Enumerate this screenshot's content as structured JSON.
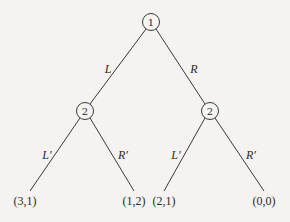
{
  "diagram": {
    "type": "extensive-form game tree",
    "nodes": [
      {
        "id": "root",
        "player": "1",
        "x": 151,
        "y": 22
      },
      {
        "id": "p2-left",
        "player": "2",
        "x": 85,
        "y": 111
      },
      {
        "id": "p2-right",
        "player": "2",
        "x": 210,
        "y": 111
      }
    ],
    "edges": [
      {
        "from": "root",
        "to": "p2-left",
        "label": "L",
        "lx": 108,
        "ly": 69
      },
      {
        "from": "root",
        "to": "p2-right",
        "label": "R",
        "lx": 194,
        "ly": 69
      },
      {
        "from": "p2-left",
        "to": "leaf-1",
        "label": "L′",
        "lx": 47,
        "ly": 155
      },
      {
        "from": "p2-left",
        "to": "leaf-2",
        "label": "R′",
        "lx": 123,
        "ly": 155
      },
      {
        "from": "p2-right",
        "to": "leaf-3",
        "label": "L′",
        "lx": 176,
        "ly": 155
      },
      {
        "from": "p2-right",
        "to": "leaf-4",
        "label": "R′",
        "lx": 251,
        "ly": 155
      }
    ],
    "leaves": [
      {
        "id": "leaf-1",
        "payoff": "(3,1)",
        "x": 25,
        "y": 201,
        "ex": 30,
        "ey": 191
      },
      {
        "id": "leaf-2",
        "payoff": "(1,2)",
        "x": 134,
        "y": 201,
        "ex": 134,
        "ey": 191
      },
      {
        "id": "leaf-3",
        "payoff": "(2,1)",
        "x": 164,
        "y": 201,
        "ex": 164,
        "ey": 191
      },
      {
        "id": "leaf-4",
        "payoff": "(0,0)",
        "x": 264,
        "y": 201,
        "ex": 264,
        "ey": 191
      }
    ]
  }
}
